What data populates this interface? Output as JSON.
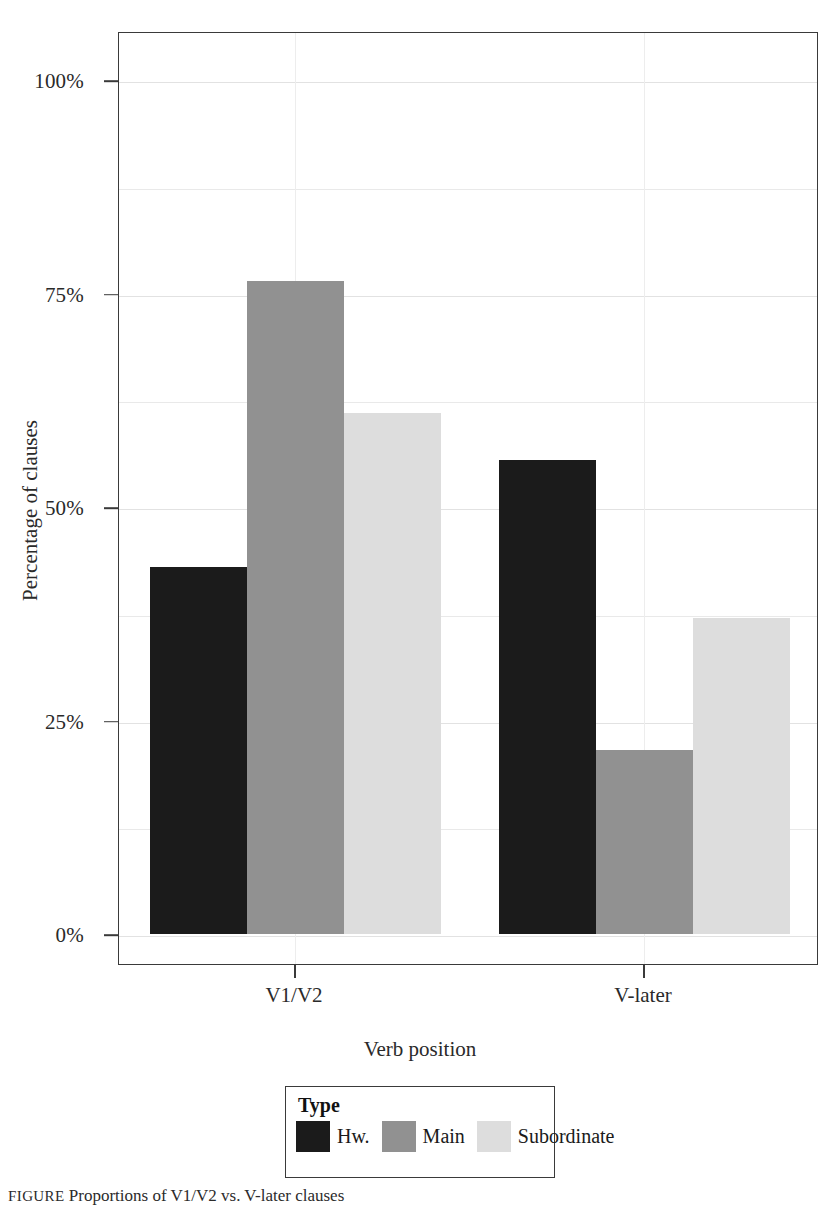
{
  "figure": {
    "caption_label": "FIGURE",
    "caption_text": "Proportions of V1/V2 vs. V-later clauses"
  },
  "axes": {
    "y_title": "Percentage of clauses",
    "x_title": "Verb position",
    "y_ticks": [
      "0%",
      "25%",
      "50%",
      "75%",
      "100%"
    ],
    "x_ticks": [
      "V1/V2",
      "V-later"
    ]
  },
  "legend": {
    "title": "Type",
    "entries": [
      {
        "label": "Hw.",
        "color": "#1b1b1b"
      },
      {
        "label": "Main",
        "color": "#919191"
      },
      {
        "label": "Subordinate",
        "color": "#dddddd"
      }
    ]
  },
  "chart_data": {
    "type": "bar",
    "title": "",
    "xlabel": "Verb position",
    "ylabel": "Percentage of clauses",
    "categories": [
      "V1/V2",
      "V-later"
    ],
    "series": [
      {
        "name": "Hw.",
        "color": "#1b1b1b",
        "values": [
          43,
          55.5
        ]
      },
      {
        "name": "Main",
        "color": "#919191",
        "values": [
          76.5,
          21.5
        ]
      },
      {
        "name": "Subordinate",
        "color": "#dddddd",
        "values": [
          61,
          37
        ]
      }
    ],
    "ylim": [
      0,
      108
    ],
    "ytick_values": [
      0,
      25,
      50,
      75,
      100
    ],
    "yminor_values": [
      12.5,
      37.5,
      62.5,
      87.5
    ],
    "grid": true,
    "legend_position": "bottom"
  }
}
